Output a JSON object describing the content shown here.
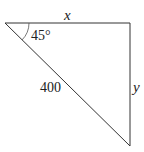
{
  "diagram": {
    "type": "right-triangle",
    "labels": {
      "top_side": "x",
      "right_side": "y",
      "hypotenuse": "400",
      "angle": "45°"
    },
    "colors": {
      "stroke": "#333333",
      "text": "#222222"
    }
  }
}
